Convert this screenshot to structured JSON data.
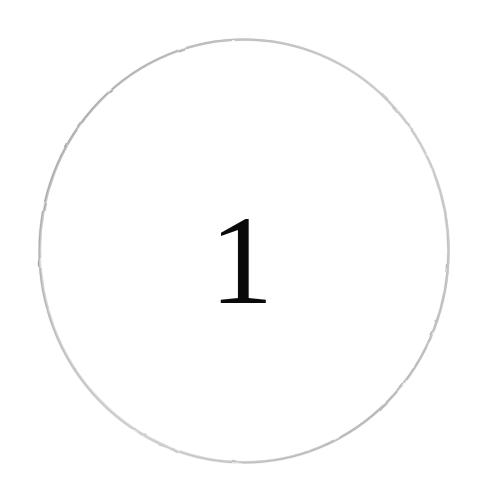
{
  "canvas": {
    "width": 483,
    "height": 493,
    "background_color": "#ffffff"
  },
  "figure": {
    "name": "numbered-circle",
    "shape": "circle",
    "label": "1",
    "center_x": 244,
    "center_y": 251,
    "radius_x": 205,
    "radius_y": 212,
    "stroke_width": 2,
    "fill_color": "#ffffff",
    "stroke_colors": {
      "upper_left": "#8d8d8d",
      "left": "#9a9a9a",
      "lower_right": "#979797",
      "upper_right": "#c9c9c9",
      "lower_left": "#d2d2d2",
      "top": "#cdcdcd",
      "bottom": "#bdbdbd"
    }
  },
  "numeral": {
    "text": "1",
    "color": "#0a0a0a",
    "font_size_px": 128,
    "center_x": 245,
    "top_y": 205,
    "bottom_y": 303
  }
}
